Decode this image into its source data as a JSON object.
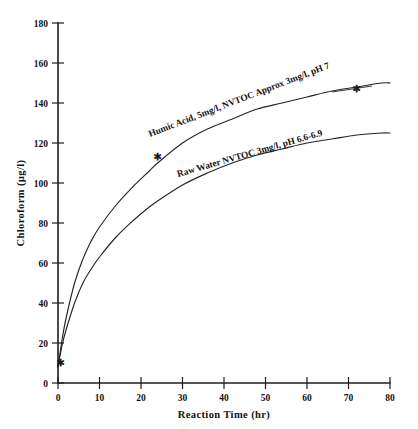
{
  "chart_data": {
    "type": "line",
    "title": "",
    "xlabel": "Reaction Time (hr)",
    "ylabel": "Chloroform (µg/l)",
    "xlim": [
      0,
      80
    ],
    "ylim": [
      0,
      180
    ],
    "xticks": [
      0,
      10,
      20,
      30,
      40,
      50,
      60,
      70,
      80
    ],
    "yticks": [
      0,
      20,
      40,
      60,
      80,
      100,
      120,
      140,
      160,
      180
    ],
    "xtick_labels": [
      "0",
      "10",
      "20",
      "30",
      "40",
      "50",
      "60",
      "70",
      "80"
    ],
    "ytick_labels": [
      "0",
      "20",
      "40",
      "60",
      "80",
      "100",
      "120",
      "140",
      "160",
      "180"
    ],
    "grid": false,
    "legend_position": "inline-curve-labels",
    "series": [
      {
        "name": "Humic Acid, 5mg/l, NVTOC Approx 3mg/l, pH 7",
        "label_text": "Humic Acid, 5mg/l, NVTOC Approx 3mg/l, pH 7",
        "x": [
          0,
          1,
          2,
          4,
          6,
          8,
          10,
          14,
          18,
          22,
          24,
          30,
          36,
          42,
          48,
          54,
          60,
          66,
          72,
          78,
          80
        ],
        "y": [
          8,
          22,
          33,
          50,
          62,
          71,
          78,
          89,
          98,
          106,
          110,
          120,
          127,
          132,
          137,
          140,
          143,
          146,
          148,
          150,
          150
        ],
        "markers": [
          {
            "x": 24,
            "y": 113
          },
          {
            "x": 72,
            "y": 147
          }
        ]
      },
      {
        "name": "Raw Water NVTOC 3mg/l, pH 6.6-6.9",
        "label_text": "Raw Water NVTOC 3mg/l, pH 6.6-6.9",
        "x": [
          0,
          1,
          2,
          4,
          6,
          8,
          10,
          14,
          18,
          22,
          24,
          30,
          36,
          42,
          48,
          54,
          60,
          66,
          72,
          78,
          80
        ],
        "y": [
          8,
          19,
          27,
          40,
          50,
          57,
          63,
          73,
          81,
          88,
          91,
          99,
          105,
          110,
          114,
          117,
          120,
          122,
          124,
          125,
          125
        ],
        "markers": []
      }
    ],
    "origin_marker": {
      "x": 0.5,
      "y": 10
    }
  },
  "colors": {
    "axis": "#1d1d1d",
    "curve": "#262626",
    "background": "#ffffff",
    "text": "#121212"
  }
}
